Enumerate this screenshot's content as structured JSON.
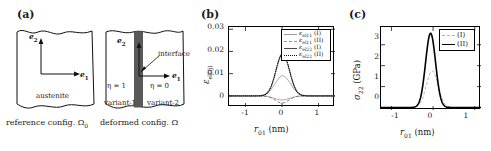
{
  "figure": {
    "panels": [
      {
        "id": "a",
        "label": "(a)"
      },
      {
        "id": "b",
        "label": "(b)"
      },
      {
        "id": "c",
        "label": "(c)"
      }
    ]
  },
  "panel_a": {
    "label": "(a)",
    "left_box": {
      "body_text": "austenite",
      "caption": "reference config. Ω",
      "caption_sub": "0",
      "vector_e1": "e",
      "vector_e1_sub": "1",
      "vector_e2": "e",
      "vector_e2_sub": "2"
    },
    "right_box": {
      "caption": "deformed config. Ω",
      "interface_label": "interface",
      "eta_left": "η = 1",
      "eta_right": "η = 0",
      "variant_left": "variant-1",
      "variant_right": "variant-2",
      "vector_e1": "e",
      "vector_e1_sub": "1",
      "vector_e2": "e",
      "vector_e2_sub": "2",
      "interface_color": "#595959"
    }
  },
  "chart_data": [
    {
      "panel": "b",
      "type": "line",
      "title": "",
      "xlabel": "r01 (nm)",
      "ylabel": "eel(ij)",
      "xlabel_main": "r",
      "xlabel_sub": "01",
      "xlabel_unit": " (nm)",
      "ylabel_main": "ε",
      "ylabel_sub": "el(ij)",
      "xlim": [
        -1.45,
        1.45
      ],
      "ylim": [
        -0.005,
        0.031
      ],
      "xticks": [
        -1,
        0,
        1
      ],
      "xticklabels": [
        "-1",
        "0",
        "1"
      ],
      "yticks": [
        0,
        0.01,
        0.02,
        0.03
      ],
      "yticklabels": [
        "0",
        "0.01",
        "0.02",
        "0.03"
      ],
      "grid": false,
      "legend_position": "upper right",
      "series": [
        {
          "name": "eel11 (I)",
          "symbol": "ε",
          "sub": "el11",
          "group": "(I)",
          "style": "solid",
          "color": "#9a9a9a",
          "peak": -0.0018,
          "peak_x": 0.0,
          "width": 0.3,
          "sign": "negative"
        },
        {
          "name": "eel11 (II)",
          "symbol": "ε",
          "sub": "el11",
          "group": "(II)",
          "style": "dashed",
          "color": "#6a6a6a",
          "peak": -0.0032,
          "peak_x": 0.0,
          "width": 0.26,
          "sign": "negative"
        },
        {
          "name": "eel22 (I)",
          "symbol": "ε",
          "sub": "el22",
          "group": "(I)",
          "style": "solid",
          "color": "#9a9a9a",
          "peak": 0.009,
          "peak_x": 0.02,
          "width": 0.3,
          "sign": "positive"
        },
        {
          "name": "eel22 (II)",
          "symbol": "ε",
          "sub": "el22",
          "group": "(II)",
          "style": "dotted",
          "color": "#111111",
          "peak": 0.019,
          "peak_x": 0.02,
          "width": 0.26,
          "sign": "positive"
        }
      ],
      "legend": [
        {
          "label_main": "ε",
          "label_sub": "el11",
          "group": "(I)",
          "key": "k-solid-gray"
        },
        {
          "label_main": "ε",
          "label_sub": "el11",
          "group": "(II)",
          "key": "k-dash-gray"
        },
        {
          "label_main": "ε",
          "label_sub": "el22",
          "group": "(I)",
          "key": "k-solid-dk"
        },
        {
          "label_main": "ε",
          "label_sub": "el22",
          "group": "(II)",
          "key": "k-dot-dk"
        }
      ]
    },
    {
      "panel": "c",
      "type": "line",
      "title": "",
      "xlabel": "r01 (nm)",
      "ylabel": "sigma22 (GPa)",
      "xlabel_main": "r",
      "xlabel_sub": "01",
      "xlabel_unit": " (nm)",
      "ylabel_main": "σ",
      "ylabel_sub": "22",
      "ylabel_unit": " (GPa)",
      "xlim": [
        -1.25,
        1.15
      ],
      "ylim": [
        -0.12,
        3.85
      ],
      "xticks": [
        -1,
        0,
        1
      ],
      "xticklabels": [
        "-1",
        "0",
        "1"
      ],
      "yticks": [
        0,
        1,
        2,
        3
      ],
      "yticklabels": [
        "0",
        "1",
        "2",
        "3"
      ],
      "grid": false,
      "legend_position": "upper right",
      "series": [
        {
          "name": "(I)",
          "group": "(I)",
          "style": "dashed",
          "color": "#b0b0b0",
          "peak": 1.75,
          "peak_x": -0.02,
          "width": 0.2
        },
        {
          "name": "(II)",
          "group": "(II)",
          "style": "solid",
          "color": "#000000",
          "peak": 3.55,
          "peak_x": -0.06,
          "width": 0.17
        }
      ],
      "legend": [
        {
          "group": "(I)",
          "key": "k-dash-lt"
        },
        {
          "group": "(II)",
          "key": "k-solid-black"
        }
      ]
    }
  ]
}
